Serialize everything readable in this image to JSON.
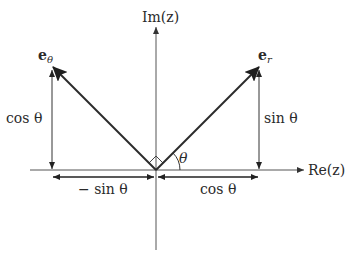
{
  "diagram": {
    "axes": {
      "real_label": "Re(z)",
      "imag_label": "Im(z)"
    },
    "vectors": {
      "e_r": {
        "label_base": "e",
        "label_sub": "r"
      },
      "e_theta": {
        "label_base": "e",
        "label_sub": "θ"
      }
    },
    "angle_label": "θ",
    "components": {
      "e_r_vertical": "sin θ",
      "e_r_horizontal": "cos θ",
      "e_theta_vertical": "cos θ",
      "e_theta_horizontal": "− sin θ"
    },
    "colors": {
      "vector": "#2b2b2b",
      "axis": "#555555",
      "text": "#2a2a2a",
      "background": "#ffffff"
    }
  }
}
